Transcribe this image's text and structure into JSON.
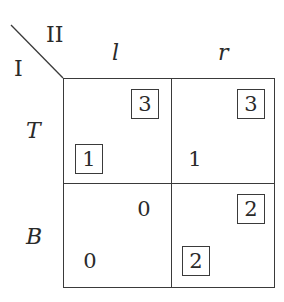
{
  "players": {
    "row_player": "I",
    "column_player": "II"
  },
  "column_strategies": [
    "l",
    "r"
  ],
  "row_strategies": [
    "T",
    "B"
  ],
  "cells": {
    "T_l": {
      "row_payoff": "1",
      "row_boxed": true,
      "col_payoff": "3",
      "col_boxed": true
    },
    "T_r": {
      "row_payoff": "1",
      "row_boxed": false,
      "col_payoff": "3",
      "col_boxed": true
    },
    "B_l": {
      "row_payoff": "0",
      "row_boxed": false,
      "col_payoff": "0",
      "col_boxed": false
    },
    "B_r": {
      "row_payoff": "2",
      "row_boxed": true,
      "col_payoff": "2",
      "col_boxed": true
    }
  },
  "colors": {
    "line": "#3a3a3a",
    "text": "#2a2a2a",
    "background": "#ffffff"
  }
}
